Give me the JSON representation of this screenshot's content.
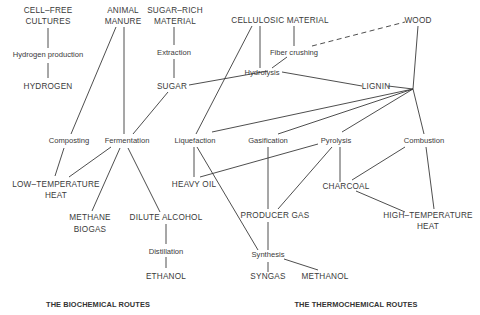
{
  "diagram": {
    "nodes": {
      "cell_free_1": "CELL–FREE",
      "cell_free_2": "CULTURES",
      "hydrogen_production": "Hydrogen production",
      "hydrogen": "HYDROGEN",
      "animal_1": "ANIMAL",
      "animal_2": "MANURE",
      "sugar_rich_1": "SUGAR–RICH",
      "sugar_rich_2": "MATERIAL",
      "extraction": "Extraction",
      "sugar": "SUGAR",
      "cellulosic": "CELLULOSIC MATERIAL",
      "fiber_crushing": "Fiber crushing",
      "wood": "WOOD",
      "hydrolysis": "Hydrolysis",
      "lignin": "LIGNIN",
      "composting": "Composting",
      "fermentation": "Fermentation",
      "liquefaction": "Liquefaction",
      "gasification": "Gasification",
      "pyrolysis": "Pyrolysis",
      "combustion": "Combustion",
      "low_temp_1": "LOW–TEMPERATURE",
      "low_temp_2": "HEAT",
      "heavy_oil": "HEAVY OIL",
      "charcoal": "CHARCOAL",
      "methane_1": "METHANE",
      "methane_2": "BIOGAS",
      "dilute_alcohol": "DILUTE ALCOHOL",
      "producer_gas": "PRODUCER GAS",
      "high_temp_1": "HIGH–TEMPERATURE",
      "high_temp_2": "HEAT",
      "distillation": "Distillation",
      "synthesis": "Synthesis",
      "ethanol": "ETHANOL",
      "syngas": "SYNGAS",
      "methanol": "METHANOL"
    },
    "sections": {
      "biochemical": "THE BIOCHEMICAL ROUTES",
      "thermochemical": "THE THERMOCHEMICAL ROUTES"
    },
    "edges": [
      [
        "CELL-FREE CULTURES",
        "Hydrogen production"
      ],
      [
        "Hydrogen production",
        "HYDROGEN"
      ],
      [
        "ANIMAL MANURE",
        "Composting"
      ],
      [
        "ANIMAL MANURE",
        "Fermentation"
      ],
      [
        "SUGAR-RICH MATERIAL",
        "Extraction"
      ],
      [
        "Extraction",
        "SUGAR"
      ],
      [
        "SUGAR",
        "Fermentation"
      ],
      [
        "SUGAR",
        "Hydrolysis"
      ],
      [
        "CELLULOSIC MATERIAL",
        "Hydrolysis"
      ],
      [
        "CELLULOSIC MATERIAL",
        "Fiber crushing"
      ],
      [
        "CELLULOSIC MATERIAL",
        "Liquefaction"
      ],
      [
        "Fiber crushing",
        "Hydrolysis"
      ],
      [
        "Fiber crushing",
        "WOOD",
        "dashed"
      ],
      [
        "Hydrolysis",
        "LIGNIN"
      ],
      [
        "WOOD",
        "Combustion"
      ],
      [
        "LIGNIN",
        "Liquefaction"
      ],
      [
        "LIGNIN",
        "Gasification"
      ],
      [
        "LIGNIN",
        "Pyrolysis"
      ],
      [
        "Composting",
        "LOW-TEMPERATURE HEAT"
      ],
      [
        "Fermentation",
        "LOW-TEMPERATURE HEAT"
      ],
      [
        "Fermentation",
        "METHANE BIOGAS"
      ],
      [
        "Fermentation",
        "DILUTE ALCOHOL"
      ],
      [
        "DILUTE ALCOHOL",
        "Distillation"
      ],
      [
        "Distillation",
        "ETHANOL"
      ],
      [
        "Liquefaction",
        "HEAVY OIL"
      ],
      [
        "Liquefaction",
        "Synthesis"
      ],
      [
        "Pyrolysis",
        "HEAVY OIL"
      ],
      [
        "Pyrolysis",
        "PRODUCER GAS"
      ],
      [
        "Pyrolysis",
        "CHARCOAL"
      ],
      [
        "Gasification",
        "PRODUCER GAS"
      ],
      [
        "Combustion",
        "CHARCOAL"
      ],
      [
        "Combustion",
        "HIGH-TEMPERATURE HEAT"
      ],
      [
        "CHARCOAL",
        "HIGH-TEMPERATURE HEAT"
      ],
      [
        "PRODUCER GAS",
        "Synthesis"
      ],
      [
        "Synthesis",
        "SYNGAS"
      ],
      [
        "Synthesis",
        "METHANOL"
      ]
    ]
  }
}
